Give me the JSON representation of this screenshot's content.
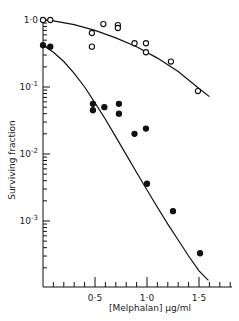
{
  "chart_data": {
    "type": "scatter",
    "title": "",
    "xlabel": "[Melphalan]  µg/ml",
    "ylabel": "Surviving fraction",
    "xscale": "linear",
    "yscale": "log",
    "xlim": [
      0,
      1.8
    ],
    "ylim": [
      0.0001,
      1.0
    ],
    "grid": false,
    "legend": null,
    "x_ticks": [
      {
        "value": 0.5,
        "label": "0·5"
      },
      {
        "value": 1.0,
        "label": "1·0"
      },
      {
        "value": 1.5,
        "label": "1·5"
      }
    ],
    "y_ticks": [
      {
        "value": 1.0,
        "label": "1·0",
        "base": "10",
        "exp": ""
      },
      {
        "value": 0.1,
        "label": "10^-1",
        "base": "10",
        "exp": "-1"
      },
      {
        "value": 0.01,
        "label": "10^-2",
        "base": "10",
        "exp": "-2"
      },
      {
        "value": 0.001,
        "label": "10^-3",
        "base": "10",
        "exp": "-3"
      }
    ],
    "series": [
      {
        "name": "open circles",
        "marker": "open-circle",
        "x": [
          0.0,
          0.07,
          0.47,
          0.47,
          0.58,
          0.72,
          0.72,
          0.88,
          0.99,
          0.99,
          1.23,
          1.49
        ],
        "y": [
          1.0,
          1.0,
          0.64,
          0.4,
          0.87,
          0.84,
          0.76,
          0.45,
          0.45,
          0.33,
          0.24,
          0.087
        ],
        "fit_curve": {
          "x": [
            0.0,
            0.1,
            0.3,
            0.5,
            0.7,
            0.9,
            1.1,
            1.3,
            1.5,
            1.6
          ],
          "y": [
            1.0,
            0.97,
            0.85,
            0.7,
            0.54,
            0.4,
            0.27,
            0.17,
            0.095,
            0.072
          ]
        }
      },
      {
        "name": "filled circles",
        "marker": "filled-circle",
        "x": [
          0.0,
          0.07,
          0.48,
          0.48,
          0.59,
          0.73,
          0.73,
          0.88,
          0.99,
          1.0,
          1.25,
          1.51
        ],
        "y": [
          0.42,
          0.4,
          0.056,
          0.045,
          0.05,
          0.056,
          0.04,
          0.02,
          0.024,
          0.0036,
          0.0014,
          0.00033
        ],
        "fit_curve": {
          "x": [
            0.0,
            0.1,
            0.2,
            0.3,
            0.4,
            0.5,
            0.6,
            0.7,
            0.8,
            0.9,
            1.0,
            1.1,
            1.2,
            1.3,
            1.4,
            1.5,
            1.59
          ],
          "y": [
            0.42,
            0.33,
            0.24,
            0.16,
            0.1,
            0.058,
            0.033,
            0.018,
            0.0098,
            0.0053,
            0.0029,
            0.0016,
            0.0009,
            0.00052,
            0.0003,
            0.00018,
            0.00013
          ]
        }
      }
    ]
  },
  "axes": {
    "x_title": "[Melphalan]  µg/ml",
    "y_title": "Surviving fraction"
  }
}
